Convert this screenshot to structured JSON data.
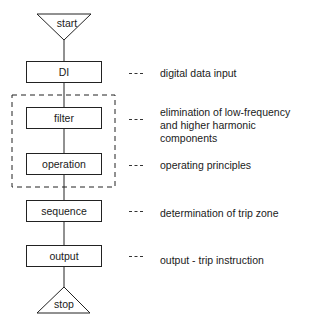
{
  "diagram": {
    "terminals": {
      "start": "start",
      "stop": "stop"
    },
    "steps": [
      {
        "label": "DI",
        "description": "digital data input"
      },
      {
        "label": "filter",
        "description": "elimination of low-frequency and higher harmonic components"
      },
      {
        "label": "operation",
        "description": "operating principles"
      },
      {
        "label": "sequence",
        "description": "determination of trip zone"
      },
      {
        "label": "output",
        "description": "output - trip instruction"
      }
    ],
    "group": {
      "members": [
        "filter",
        "operation"
      ],
      "style": "dashed"
    }
  }
}
